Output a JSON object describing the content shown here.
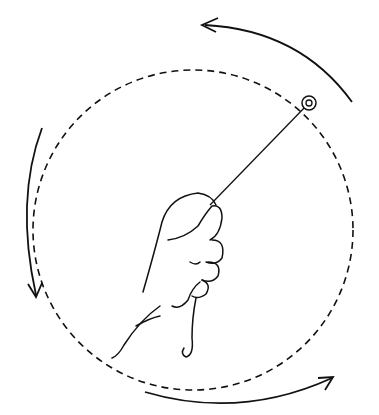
{
  "figure": {
    "elements": [
      "hand",
      "string",
      "object",
      "circular-path",
      "rotation-arrows"
    ],
    "stroke_color": "#111111",
    "background": "#ffffff",
    "arrow_direction": "counterclockwise"
  }
}
